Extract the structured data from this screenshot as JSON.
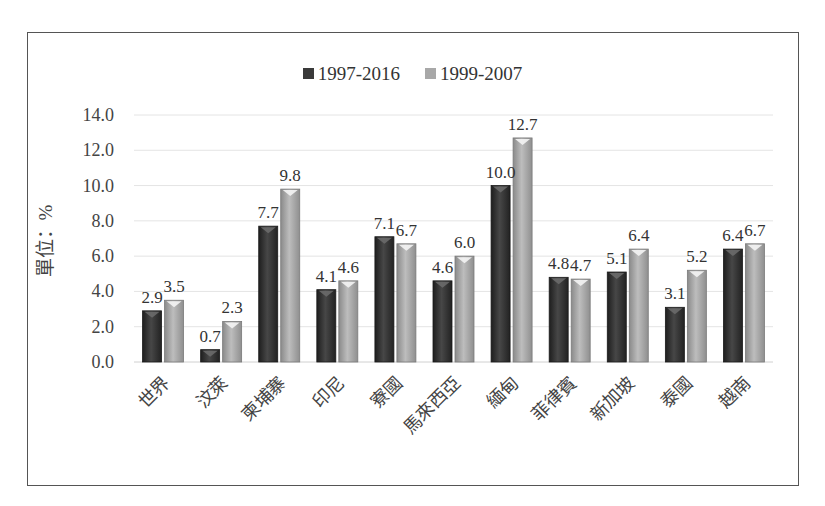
{
  "chart_data": {
    "type": "bar",
    "title": "",
    "xlabel": "",
    "ylabel": "單位：%",
    "ylim": [
      0,
      14
    ],
    "yticks": [
      "0.0",
      "2.0",
      "4.0",
      "6.0",
      "8.0",
      "10.0",
      "12.0",
      "14.0"
    ],
    "grid": true,
    "legend_position": "top-center",
    "categories": [
      "世界",
      "汶萊",
      "柬埔寨",
      "印尼",
      "寮國",
      "馬來西亞",
      "緬甸",
      "菲律賓",
      "新加坡",
      "泰國",
      "越南"
    ],
    "series": [
      {
        "name": "1997-2016",
        "color": "#3a3a3a",
        "values": [
          2.9,
          0.7,
          7.7,
          4.1,
          7.1,
          4.6,
          10.0,
          4.8,
          5.1,
          3.1,
          6.4
        ],
        "labels": [
          "2.9",
          "0.7",
          "7.7",
          "4.1",
          "7.1",
          "4.6",
          "10.0",
          "4.8",
          "5.1",
          "3.1",
          "6.4"
        ]
      },
      {
        "name": "1999-2007",
        "color": "#a8a8a8",
        "values": [
          3.5,
          2.3,
          9.8,
          4.6,
          6.7,
          6.0,
          12.7,
          4.7,
          6.4,
          5.2,
          6.7
        ],
        "labels": [
          "3.5",
          "2.3",
          "9.8",
          "4.6",
          "6.7",
          "6.0",
          "12.7",
          "4.7",
          "6.4",
          "5.2",
          "6.7"
        ]
      }
    ]
  }
}
